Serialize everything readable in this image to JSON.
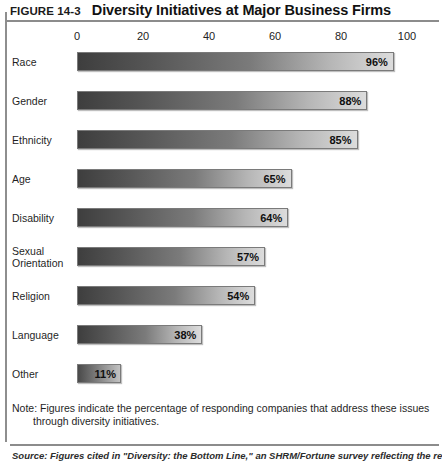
{
  "figure": {
    "number": "FIGURE 14-3",
    "title": "Diversity Initiatives at Major Business Firms"
  },
  "note": {
    "line1": "Note: Figures indicate the percentage of responding companies that address these issues",
    "line2": "through diversity initiatives."
  },
  "source": {
    "text": "Source: Figures cited in \"Diversity: the Bottom Line,\" an SHRM/Fortune survey reflecting the responses of 121 HR"
  },
  "chart_data": {
    "type": "bar",
    "orientation": "horizontal",
    "title": "Diversity Initiatives at Major Business Firms",
    "xlabel": "",
    "ylabel": "",
    "xlim": [
      0,
      100
    ],
    "xticks": [
      0,
      20,
      40,
      60,
      80,
      100
    ],
    "xtick_labels": [
      "0",
      "20",
      "40",
      "60",
      "80",
      "100"
    ],
    "grid": false,
    "legend": "none",
    "value_suffix": "%",
    "categories": [
      "Race",
      "Gender",
      "Ethnicity",
      "Age",
      "Disability",
      "Sexual Orientation",
      "Religion",
      "Language",
      "Other"
    ],
    "values": [
      96,
      88,
      85,
      65,
      64,
      57,
      54,
      38,
      11
    ],
    "bars": [
      {
        "label": "Race",
        "label_line1": "Race",
        "label_line2": "",
        "value": 96,
        "value_label": "96%"
      },
      {
        "label": "Gender",
        "label_line1": "Gender",
        "label_line2": "",
        "value": 88,
        "value_label": "88%"
      },
      {
        "label": "Ethnicity",
        "label_line1": "Ethnicity",
        "label_line2": "",
        "value": 85,
        "value_label": "85%"
      },
      {
        "label": "Age",
        "label_line1": "Age",
        "label_line2": "",
        "value": 65,
        "value_label": "65%"
      },
      {
        "label": "Disability",
        "label_line1": "Disability",
        "label_line2": "",
        "value": 64,
        "value_label": "64%"
      },
      {
        "label": "Sexual Orientation",
        "label_line1": "Sexual",
        "label_line2": "Orientation",
        "value": 57,
        "value_label": "57%"
      },
      {
        "label": "Religion",
        "label_line1": "Religion",
        "label_line2": "",
        "value": 54,
        "value_label": "54%"
      },
      {
        "label": "Language",
        "label_line1": "Language",
        "label_line2": "",
        "value": 38,
        "value_label": "38%"
      },
      {
        "label": "Other",
        "label_line1": "Other",
        "label_line2": "",
        "value": 11,
        "value_label": "11%"
      }
    ],
    "colors": {
      "bar_gradient_start": "#3e3e3e",
      "bar_gradient_end": "#dcdcdc",
      "bar_border": "#7a7a7a",
      "text": "#1f1f1f",
      "rule": "#8c8c8c"
    }
  }
}
